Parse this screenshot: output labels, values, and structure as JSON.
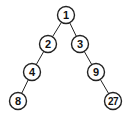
{
  "diagram": {
    "type": "binary-tree",
    "nodes": [
      {
        "id": "n1",
        "label": "1"
      },
      {
        "id": "n2",
        "label": "2"
      },
      {
        "id": "n3",
        "label": "3"
      },
      {
        "id": "n4",
        "label": "4"
      },
      {
        "id": "n9",
        "label": "9"
      },
      {
        "id": "n8",
        "label": "8"
      },
      {
        "id": "n27",
        "label": "27"
      }
    ],
    "edges": [
      {
        "from": "n1",
        "to": "n2"
      },
      {
        "from": "n1",
        "to": "n3"
      },
      {
        "from": "n2",
        "to": "n4"
      },
      {
        "from": "n3",
        "to": "n9"
      },
      {
        "from": "n4",
        "to": "n8"
      },
      {
        "from": "n9",
        "to": "n27"
      }
    ]
  }
}
